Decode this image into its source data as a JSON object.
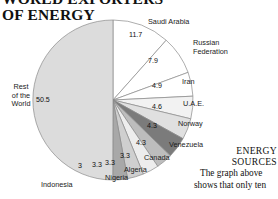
{
  "title": "WORLD EXPORTERS\nOF ENERGY",
  "colors": {
    "outline": "#8a8a8a",
    "text": "#1b1b1b",
    "rest_of_world": "#dcdcdc",
    "white_slice": "#ffffff",
    "light_gray": "#e3e3e3",
    "mid_gray": "#c9c9c9",
    "dark_gray": "#949494",
    "darkest_gray": "#7b7b7b"
  },
  "chart_data": {
    "type": "pie",
    "title": "WORLD EXPORTERS OF ENERGY",
    "xlabel": "",
    "ylabel": "",
    "legend": "none",
    "units": "percent",
    "categories": [
      "Rest of the World",
      "Saudi Arabia",
      "Russian Federation",
      "Iran",
      "U.A.E.",
      "Norway",
      "Venezuela",
      "Canada",
      "Algeria",
      "Nigeria",
      "Indonesia"
    ],
    "values": [
      50.5,
      11.7,
      7.9,
      4.9,
      4.6,
      4.3,
      4.3,
      3.3,
      3.3,
      3.3,
      3
    ],
    "slice_colors": [
      "#dcdcdc",
      "#ffffff",
      "#ffffff",
      "#ffffff",
      "#f2f2f2",
      "#e0e0e0",
      "#7b7b7b",
      "#bdbdbd",
      "#ededed",
      "#cfcfcf",
      "#a8a8a8"
    ],
    "value_labels": [
      "50.5",
      "11.7",
      "7.9",
      "4.9",
      "4.6",
      "4.3",
      "4.3",
      "3.3",
      "3.3",
      "3.3",
      "3"
    ]
  },
  "slice_labels": {
    "rest_of_world": "Rest\nof the\nWorld",
    "saudi_arabia": "Saudi Arabia",
    "russian_federation": "Russian\nFederation",
    "iran": "Iran",
    "uae": "U.A.E.",
    "norway": "Norway",
    "venezuela": "Venezuela",
    "canada": "Canada",
    "algeria": "Algeria",
    "nigeria": "Nigeria",
    "indonesia": "Indonesia"
  },
  "slice_values": {
    "rest_of_world": "50.5",
    "saudi_arabia": "11.7",
    "russian_federation": "7.9",
    "iran": "4.9",
    "uae": "4.6",
    "norway": "4.3",
    "venezuela": "4.3",
    "canada": "3.3",
    "algeria": "3.3",
    "nigeria": "3.3",
    "indonesia": "3"
  },
  "article": {
    "heading": "ENERGY\nSOURCES",
    "body": "The graph above shows that only ten"
  }
}
